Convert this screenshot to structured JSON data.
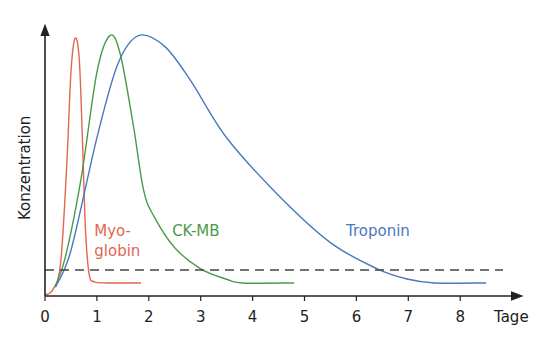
{
  "chart_data": {
    "type": "line",
    "title": "",
    "xlabel": "Tage",
    "ylabel": "Konzentration",
    "xlim": [
      0,
      8.5
    ],
    "ylim": [
      0,
      100
    ],
    "x_ticks": [
      "0",
      "1",
      "2",
      "3",
      "4",
      "5",
      "6",
      "7",
      "8"
    ],
    "grid": false,
    "threshold": {
      "y": 9.5,
      "style": "dashed",
      "color": "#444444"
    },
    "series": [
      {
        "name": "Myoglobin",
        "label_lines": [
          "Myo-",
          "globin"
        ],
        "color": "#e0674f",
        "points": [
          [
            0,
            0
          ],
          [
            0.15,
            2
          ],
          [
            0.3,
            12
          ],
          [
            0.42,
            50
          ],
          [
            0.5,
            85
          ],
          [
            0.58,
            98
          ],
          [
            0.66,
            90
          ],
          [
            0.72,
            60
          ],
          [
            0.78,
            25
          ],
          [
            0.85,
            8
          ],
          [
            0.95,
            5
          ],
          [
            1.2,
            4.6
          ],
          [
            1.85,
            4.6
          ]
        ]
      },
      {
        "name": "CK-MB",
        "label_lines": [
          "CK-MB"
        ],
        "color": "#4a9a4a",
        "points": [
          [
            0.2,
            3
          ],
          [
            0.4,
            15
          ],
          [
            0.7,
            45
          ],
          [
            1.0,
            85
          ],
          [
            1.25,
            99
          ],
          [
            1.45,
            92
          ],
          [
            1.7,
            65
          ],
          [
            1.9,
            40
          ],
          [
            2.1,
            30
          ],
          [
            2.5,
            18
          ],
          [
            3.0,
            10
          ],
          [
            3.5,
            6
          ],
          [
            3.8,
            4.6
          ],
          [
            4.8,
            4.6
          ]
        ]
      },
      {
        "name": "Troponin",
        "label_lines": [
          "Troponin"
        ],
        "color": "#4a78c0",
        "points": [
          [
            0.2,
            3
          ],
          [
            0.5,
            17
          ],
          [
            1.0,
            60
          ],
          [
            1.4,
            88
          ],
          [
            1.8,
            99
          ],
          [
            2.3,
            95
          ],
          [
            2.8,
            82
          ],
          [
            3.5,
            60
          ],
          [
            4.5,
            38
          ],
          [
            5.5,
            20
          ],
          [
            6.4,
            10
          ],
          [
            7.0,
            6
          ],
          [
            7.5,
            4.6
          ],
          [
            8.5,
            4.6
          ]
        ]
      }
    ],
    "series_label_positions": [
      {
        "name": "Myoglobin",
        "x": 0.95,
        "y": 22
      },
      {
        "name": "CK-MB",
        "x": 2.45,
        "y": 22
      },
      {
        "name": "Troponin",
        "x": 5.8,
        "y": 22
      }
    ]
  }
}
